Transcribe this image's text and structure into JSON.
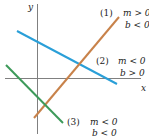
{
  "axes": {
    "x_label": "x",
    "y_label": "y",
    "axis_color": "#808080"
  },
  "lines": [
    {
      "id": "1",
      "tag": "(1)",
      "color": "#c8824a",
      "cond_m": "m > 0",
      "cond_b": "b < 0"
    },
    {
      "id": "2",
      "tag": "(2)",
      "color": "#2a9fd8",
      "cond_m": "m < 0",
      "cond_b": "b > 0"
    },
    {
      "id": "3",
      "tag": "(3)",
      "color": "#3d9a5a",
      "cond_m": "m < 0",
      "cond_b": "b < 0"
    }
  ]
}
